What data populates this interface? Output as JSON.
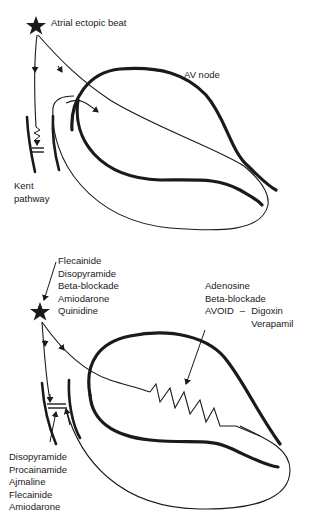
{
  "top_panel": {
    "ectopic_label": "Atrial ectopic beat",
    "av_node_label": "AV node",
    "kent_label_line1": "Kent",
    "kent_label_line2": "pathway"
  },
  "bottom_panel": {
    "ectopic_drugs": [
      "Flecainide",
      "Disopyramide",
      "Beta-blockade",
      "Amiodarone",
      "Quinidine"
    ],
    "av_node_drugs": {
      "recommended": [
        "Adenosine",
        "Beta-blockade"
      ],
      "avoid_label": "AVOID",
      "avoid_dash": "–",
      "avoid": [
        "Digoxin",
        "Verapamil"
      ]
    },
    "accessory_pathway_drugs": [
      "Disopyramide",
      "Procainamide",
      "Ajmaline",
      "Flecainide",
      "Amiodarone"
    ]
  },
  "colors": {
    "ink": "#1a1a1a",
    "background": "#ffffff"
  }
}
